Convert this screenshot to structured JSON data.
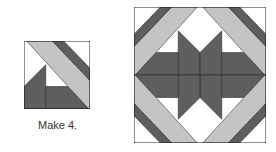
{
  "caption": "Make 4.",
  "colors": {
    "dark": "#5e5e5e",
    "light": "#c4c4c4",
    "white": "#ffffff",
    "outline": "#222222"
  },
  "small_block": {
    "label": "quilt unit",
    "count": 4
  },
  "large_block": {
    "label": "assembled quilt block",
    "units": 4
  }
}
